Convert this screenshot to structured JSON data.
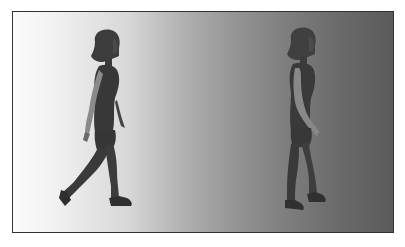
{
  "image": {
    "description": "Grayscale render of two 3D female figures walking to the right against a horizontal white-to-dark-gray gradient background, enclosed in a thin dark border",
    "figures": [
      {
        "name": "walking-figure-left",
        "pose": "mid-stride walking",
        "tone": "dark gray"
      },
      {
        "name": "walking-figure-right",
        "pose": "walking, near-standing stride",
        "tone": "dark gray, partially blended with background"
      }
    ],
    "colors": {
      "border": "#333333",
      "gradient_left": "#fbfbfb",
      "gradient_mid": "#a8a8a8",
      "gradient_right": "#5a5a5a",
      "figure_body": "#3a3a3a",
      "figure_highlight": "#8a8a8a"
    }
  }
}
